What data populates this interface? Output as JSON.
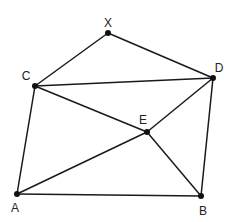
{
  "diagram": {
    "type": "geometry",
    "points": [
      {
        "id": "X",
        "label": "X",
        "x": 108,
        "y": 33,
        "lx": 108,
        "ly": 27
      },
      {
        "id": "C",
        "label": "C",
        "x": 35,
        "y": 86,
        "lx": 26,
        "ly": 80
      },
      {
        "id": "D",
        "label": "D",
        "x": 213,
        "y": 78,
        "lx": 219,
        "ly": 72
      },
      {
        "id": "E",
        "label": "E",
        "x": 147,
        "y": 132,
        "lx": 143,
        "ly": 124
      },
      {
        "id": "A",
        "label": "A",
        "x": 17,
        "y": 194,
        "lx": 15,
        "ly": 212
      },
      {
        "id": "B",
        "label": "B",
        "x": 201,
        "y": 196,
        "lx": 203,
        "ly": 215
      }
    ],
    "edges": [
      [
        "X",
        "C"
      ],
      [
        "X",
        "D"
      ],
      [
        "C",
        "D"
      ],
      [
        "C",
        "A"
      ],
      [
        "C",
        "E"
      ],
      [
        "D",
        "E"
      ],
      [
        "D",
        "B"
      ],
      [
        "A",
        "E"
      ],
      [
        "E",
        "B"
      ],
      [
        "A",
        "B"
      ]
    ],
    "colors": {
      "line": "#1a1a1a",
      "point": "#111111",
      "label": "#222222",
      "background": "#ffffff"
    }
  }
}
